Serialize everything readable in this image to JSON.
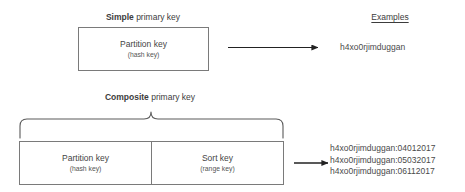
{
  "diagram": {
    "simple": {
      "title_strong": "Simple",
      "title_rest": " primary key",
      "box": {
        "partition_main": "Partition key",
        "partition_sub": "(hash key)"
      },
      "arrow": "arrow-right",
      "example": "h4xo0rjimduggan"
    },
    "composite": {
      "title_strong": "Composite",
      "title_rest": " primary key",
      "brace": "curly-brace",
      "box": {
        "partition_main": "Partition key",
        "partition_sub": "(hash key)",
        "sort_main": "Sort key",
        "sort_sub": "(range key)"
      },
      "arrow": "arrow-right",
      "examples": [
        "h4xo0rjimduggan:04012017",
        "h4xo0rjimduggan:05032017",
        "h4xo0rjimduggan:06112017"
      ]
    },
    "examples_heading": "Examples",
    "colors": {
      "background": "#ffffff",
      "box_border": "#7a7a7a",
      "text": "#4a4a4a",
      "heading_text": "#3c3c3c",
      "line": "#222222",
      "brace": "#5a5a5a"
    }
  }
}
